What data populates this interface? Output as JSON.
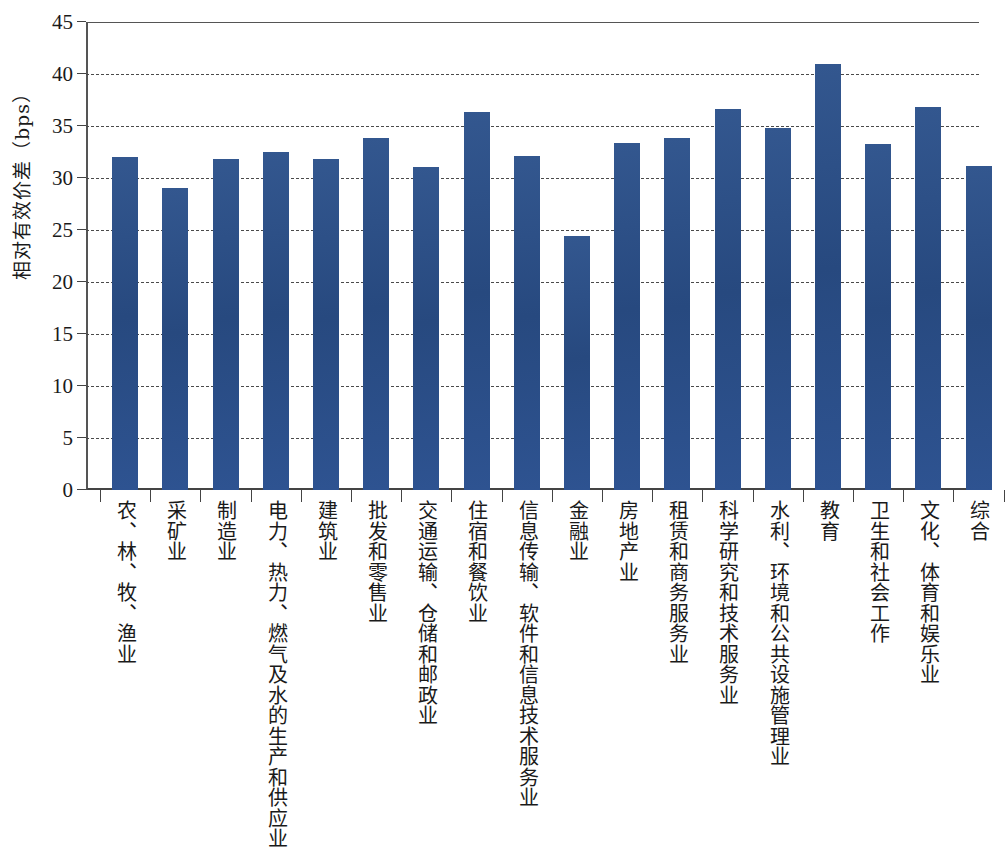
{
  "chart_data": {
    "type": "bar",
    "title": "",
    "xlabel": "",
    "ylabel": "相对有效价差（bps）",
    "ylim": [
      0,
      45
    ],
    "yticks": [
      0,
      5,
      10,
      15,
      20,
      25,
      30,
      35,
      40,
      45
    ],
    "grid": true,
    "legend": "none",
    "bar_color": "#2d5490",
    "categories": [
      "农、林、牧、渔业",
      "采矿业",
      "制造业",
      "电力、热力、燃气及水的生产和供应业",
      "建筑业",
      "批发和零售业",
      "交通运输、仓储和邮政业",
      "住宿和餐饮业",
      "信息传输、软件和信息技术服务业",
      "金融业",
      "房地产业",
      "租赁和商务服务业",
      "科学研究和技术服务业",
      "水利、环境和公共设施管理业",
      "教育",
      "卫生和社会工作",
      "文化、体育和娱乐业",
      "综合"
    ],
    "values": [
      32.0,
      29.0,
      31.8,
      32.5,
      31.8,
      33.8,
      31.1,
      36.3,
      32.1,
      24.4,
      33.4,
      33.8,
      36.6,
      34.8,
      41.0,
      33.3,
      36.8,
      31.2
    ]
  }
}
